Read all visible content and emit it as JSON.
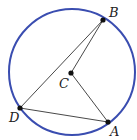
{
  "diagram": {
    "type": "circle-geometry",
    "circle": {
      "cx": 72,
      "cy": 72,
      "r": 63,
      "stroke": "#3a4db0"
    },
    "points": [
      {
        "id": "A",
        "label": "A",
        "x": 108,
        "y": 122,
        "lx": 110,
        "ly": 136
      },
      {
        "id": "B",
        "label": "B",
        "x": 103,
        "y": 20,
        "lx": 109,
        "ly": 17
      },
      {
        "id": "C",
        "label": "C",
        "x": 71,
        "y": 73,
        "lx": 59,
        "ly": 88
      },
      {
        "id": "D",
        "label": "D",
        "x": 20,
        "y": 108,
        "lx": 9,
        "ly": 122
      }
    ],
    "segments": [
      {
        "from": "B",
        "to": "D"
      },
      {
        "from": "D",
        "to": "A"
      },
      {
        "from": "A",
        "to": "C"
      },
      {
        "from": "C",
        "to": "B"
      }
    ],
    "line_color": "#333333"
  }
}
